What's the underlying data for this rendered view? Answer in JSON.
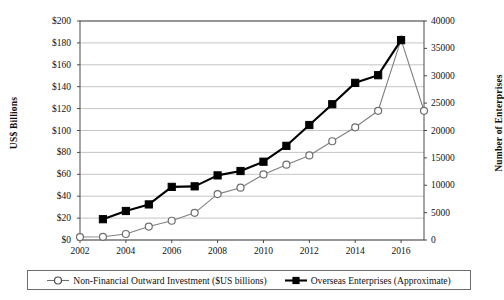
{
  "chart_data": {
    "type": "line",
    "title": "",
    "subtitle": "",
    "xlabel": "",
    "ylabel": "US$ Billions",
    "y2label": "Number of Enterprises",
    "grid": true,
    "legend_position": "bottom",
    "x": [
      2002,
      2003,
      2004,
      2005,
      2006,
      2007,
      2008,
      2009,
      2010,
      2011,
      2012,
      2013,
      2014,
      2015,
      2016,
      2017
    ],
    "xlim": [
      2002,
      2017
    ],
    "xticks": [
      2002,
      2004,
      2006,
      2008,
      2010,
      2012,
      2014,
      2016
    ],
    "xticklabels": [
      "2002",
      "2004",
      "2006",
      "2008",
      "2010",
      "2012",
      "2014",
      "2016"
    ],
    "ylim": [
      0,
      200
    ],
    "yticks": [
      0,
      20,
      40,
      60,
      80,
      100,
      120,
      140,
      160,
      180,
      200
    ],
    "yticklabels": [
      "$0",
      "$20",
      "$40",
      "$60",
      "$80",
      "$100",
      "$120",
      "$140",
      "$160",
      "$180",
      "$200"
    ],
    "y2lim": [
      0,
      40000
    ],
    "y2ticks": [
      0,
      5000,
      10000,
      15000,
      20000,
      25000,
      30000,
      35000,
      40000
    ],
    "y2ticklabels": [
      "0",
      "5000",
      "10000",
      "15000",
      "20000",
      "25000",
      "30000",
      "35000",
      "40000"
    ],
    "series": [
      {
        "name": "Non-Financial Outward Investment ($US billions)",
        "axis": "left",
        "marker": "open-circle",
        "color": "#808080",
        "x": [
          2002,
          2003,
          2004,
          2005,
          2006,
          2007,
          2008,
          2009,
          2010,
          2011,
          2012,
          2013,
          2014,
          2015,
          2016,
          2017
        ],
        "values": [
          2.7,
          2.9,
          5.5,
          12.3,
          17.6,
          24.8,
          41.9,
          47.8,
          59.9,
          68.8,
          77.2,
          90.2,
          102.9,
          118.0,
          183.0,
          118.0
        ]
      },
      {
        "name": "Overseas Enterprises (Approximate)",
        "axis": "right",
        "marker": "filled-square",
        "color": "#000000",
        "x": [
          2003,
          2004,
          2005,
          2006,
          2007,
          2008,
          2009,
          2010,
          2011,
          2012,
          2013,
          2014,
          2015,
          2016
        ],
        "values": [
          3800,
          5300,
          6500,
          9700,
          9800,
          11800,
          12600,
          14300,
          17200,
          21000,
          24800,
          28700,
          30100,
          36500
        ]
      }
    ]
  },
  "legend": {
    "entries": [
      {
        "label": "Non-Financial Outward Investment ($US billions)",
        "marker": "open-circle"
      },
      {
        "label": "Overseas Enterprises (Approximate)",
        "marker": "filled-square"
      }
    ]
  }
}
